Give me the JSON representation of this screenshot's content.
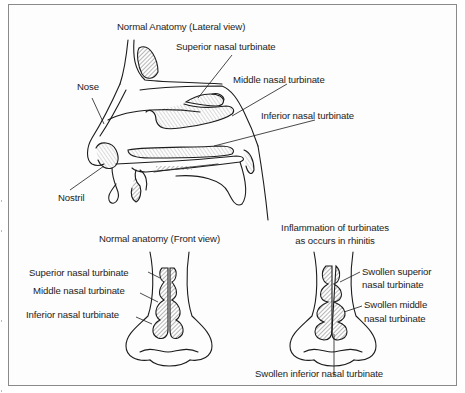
{
  "figure": {
    "lateral_view": {
      "title": "Normal Anatomy (Lateral view)",
      "labels": {
        "superior": "Superior nasal turbinate",
        "middle": "Middle nasal turbinate",
        "inferior": "Inferior nasal turbinate",
        "nose": "Nose",
        "nostril": "Nostril"
      }
    },
    "front_normal": {
      "title": "Normal anatomy (Front view)",
      "labels": {
        "superior": "Superior nasal turbinate",
        "middle": "Middle nasal turbinate",
        "inferior": "Inferior nasal turbinate"
      }
    },
    "front_inflamed": {
      "title_line1": "Inflammation of turbinates",
      "title_line2": "as occurs in rhinitis",
      "labels": {
        "superior_line1": "Swollen superior",
        "superior_line2": "nasal turbinate",
        "middle_line1": "Swollen middle",
        "middle_line2": "nasal turbinate",
        "inferior": "Swollen inferior nasal turbinate"
      }
    }
  },
  "colors": {
    "border": "#8a8a8a",
    "ink": "#1c1c1c",
    "hatch": "#7a7a7a"
  }
}
